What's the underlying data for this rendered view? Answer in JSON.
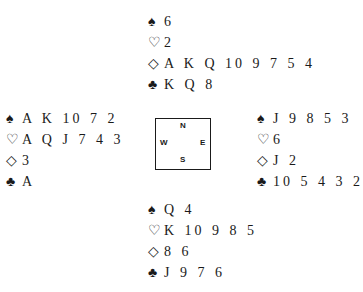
{
  "suits": {
    "spades": "♠",
    "hearts": "♡",
    "diamonds": "◇",
    "clubs": "♣"
  },
  "hands": {
    "north": {
      "spades": "6",
      "hearts": "2",
      "diamonds": "A K Q 10 9 7 5 4",
      "clubs": "K Q 8"
    },
    "west": {
      "spades": "A K 10 7 2",
      "hearts": "A Q J 7 4 3",
      "diamonds": "3",
      "clubs": "A"
    },
    "east": {
      "spades": "J 9 8 5 3",
      "hearts": "6",
      "diamonds": "J 2",
      "clubs": "10 5 4 3 2"
    },
    "south": {
      "spades": "Q 4",
      "hearts": "K 10 9 8 5",
      "diamonds": "8 6",
      "clubs": "J 9 7 6"
    }
  },
  "compass": {
    "north": "N",
    "south": "S",
    "west": "W",
    "east": "E"
  }
}
